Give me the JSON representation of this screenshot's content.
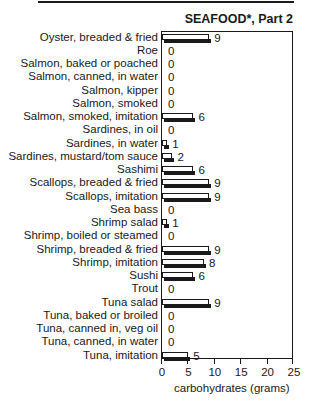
{
  "chart_data": {
    "type": "bar",
    "orientation": "horizontal",
    "title": "SEAFOOD*, Part 2",
    "xlabel": "carbohydrates (grams)",
    "ylabel": "",
    "xlim": [
      0,
      25
    ],
    "xticks": [
      0,
      5,
      10,
      15,
      20,
      25
    ],
    "grid": false,
    "categories": [
      "Oyster, breaded & fried",
      "Roe",
      "Salmon, baked or poached",
      "Salmon, canned, in water",
      "Salmon, kipper",
      "Salmon, smoked",
      "Salmon, smoked, imitation",
      "Sardines, in oil",
      "Sardines, in water",
      "Sardines, mustard/tom sauce",
      "Sashimi",
      "Scallops, breaded & fried",
      "Scallops, imitation",
      "Sea bass",
      "Shrimp salad",
      "Shrimp, boiled or steamed",
      "Shrimp, breaded & fried",
      "Shrimp, imitation",
      "Sushi",
      "Trout",
      "Tuna salad",
      "Tuna, baked or broiled",
      "Tuna, canned in, veg oil",
      "Tuna, canned, in water",
      "Tuna, imitation"
    ],
    "values": [
      9,
      0,
      0,
      0,
      0,
      0,
      6,
      0,
      1,
      2,
      6,
      9,
      9,
      0,
      1,
      0,
      9,
      8,
      6,
      0,
      9,
      0,
      0,
      0,
      5
    ],
    "value_labels": [
      "9",
      "0",
      "0",
      "0",
      "0",
      "0",
      "6",
      "0",
      "1",
      "2",
      "6",
      "9",
      "9",
      "0",
      "1",
      "0",
      "9",
      "8",
      "6",
      "0",
      "9",
      "0",
      "0",
      "0",
      "5"
    ]
  }
}
